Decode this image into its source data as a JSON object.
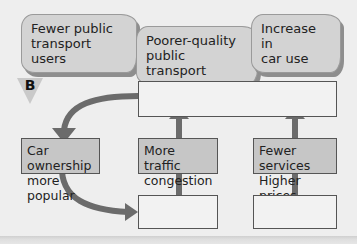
{
  "clouds": [
    {
      "label": "Fewer public\ntransport users"
    },
    {
      "label": "Poorer-quality\npublic transport"
    },
    {
      "label": "Increase in\ncar use"
    }
  ],
  "marker": {
    "label": "B"
  },
  "boxes": {
    "top_wide": {
      "label": ""
    },
    "car_ownership": {
      "label": "Car ownership\nmore popular"
    },
    "traffic": {
      "label": "More traffic\ncongestion"
    },
    "services": {
      "label": "Fewer services\nHigher prices"
    },
    "bottom_middle": {
      "label": ""
    },
    "bottom_right": {
      "label": ""
    }
  },
  "colors": {
    "background": "#eeeeee",
    "cloud_fill": "#d3d3d3",
    "filled_box": "#c6c6c6",
    "empty_box": "#f2f2f2",
    "arrow": "#6b6b6b",
    "border": "#555555"
  }
}
